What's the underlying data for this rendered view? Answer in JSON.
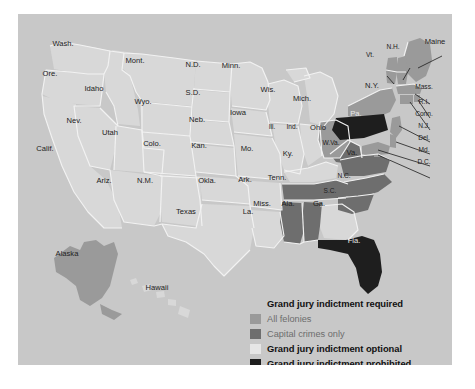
{
  "figure": {
    "panel_bg": "#c8c8c8",
    "page_bg": "#ffffff"
  },
  "colors": {
    "all_felonies": "#9a9a9a",
    "capital_crimes_only": "#6e6e6e",
    "optional": "#d8d8d8",
    "prohibited": "#1e1e1e",
    "border": "#f2f2f2",
    "label_dark": "#222222",
    "label_light": "#e8e8e8",
    "legend_title": "#111111",
    "legend_sub": "#6d6d6d"
  },
  "legend": {
    "required_title": "Grand jury indictment required",
    "sub_items": [
      {
        "label": "All felonies",
        "swatch": "all_felonies"
      },
      {
        "label": "Capital crimes only",
        "swatch": "capital_crimes_only"
      }
    ],
    "optional_title": "Grand jury indictment optional",
    "optional_swatch": "optional",
    "prohibited_title": "Grand jury indictment prohibited",
    "prohibited_swatch": "prohibited"
  },
  "chart_data": {
    "type": "map",
    "title": "Grand jury indictment required",
    "legend_position": "bottom-right",
    "categories": [
      "All felonies",
      "Capital crimes only",
      "Grand jury indictment optional",
      "Grand jury indictment prohibited"
    ],
    "states": [
      {
        "label": "Wash.",
        "category": "Grand jury indictment optional",
        "x": 63,
        "y": 46
      },
      {
        "label": "Ore.",
        "category": "Grand jury indictment optional",
        "x": 50,
        "y": 76
      },
      {
        "label": "Idaho",
        "category": "Grand jury indictment optional",
        "x": 94,
        "y": 91
      },
      {
        "label": "Mont.",
        "category": "Grand jury indictment optional",
        "x": 135,
        "y": 63
      },
      {
        "label": "Wyo.",
        "category": "Grand jury indictment optional",
        "x": 143,
        "y": 104
      },
      {
        "label": "Nev.",
        "category": "Grand jury indictment optional",
        "x": 74,
        "y": 123
      },
      {
        "label": "Utah",
        "category": "Grand jury indictment optional",
        "x": 110,
        "y": 135
      },
      {
        "label": "Calif.",
        "category": "Grand jury indictment optional",
        "x": 45,
        "y": 151
      },
      {
        "label": "Ariz.",
        "category": "Grand jury indictment optional",
        "x": 104,
        "y": 183
      },
      {
        "label": "N.M.",
        "category": "Grand jury indictment optional",
        "x": 145,
        "y": 183
      },
      {
        "label": "Colo.",
        "category": "Grand jury indictment optional",
        "x": 152,
        "y": 146
      },
      {
        "label": "N.D.",
        "category": "Grand jury indictment optional",
        "x": 193,
        "y": 67
      },
      {
        "label": "S.D.",
        "category": "Grand jury indictment optional",
        "x": 193,
        "y": 95
      },
      {
        "label": "Neb.",
        "category": "Grand jury indictment optional",
        "x": 197,
        "y": 122
      },
      {
        "label": "Kan.",
        "category": "Grand jury indictment optional",
        "x": 199,
        "y": 148
      },
      {
        "label": "Okla.",
        "category": "Grand jury indictment optional",
        "x": 207,
        "y": 183
      },
      {
        "label": "Texas",
        "category": "Grand jury indictment optional",
        "x": 186,
        "y": 214
      },
      {
        "label": "Minn.",
        "category": "Grand jury indictment optional",
        "x": 231,
        "y": 68
      },
      {
        "label": "Iowa",
        "category": "Grand jury indictment optional",
        "x": 238,
        "y": 115
      },
      {
        "label": "Mo.",
        "category": "Grand jury indictment optional",
        "x": 247,
        "y": 151
      },
      {
        "label": "Ark.",
        "category": "Grand jury indictment optional",
        "x": 245,
        "y": 182
      },
      {
        "label": "La.",
        "category": "Grand jury indictment optional",
        "x": 248,
        "y": 214
      },
      {
        "label": "Wis.",
        "category": "Grand jury indictment optional",
        "x": 268,
        "y": 92
      },
      {
        "label": "Ill.",
        "category": "Grand jury indictment optional",
        "x": 272,
        "y": 129
      },
      {
        "label": "Ind.",
        "category": "Grand jury indictment optional",
        "x": 292,
        "y": 129
      },
      {
        "label": "Mich.",
        "category": "Grand jury indictment optional",
        "x": 302,
        "y": 101
      },
      {
        "label": "Ky.",
        "category": "Grand jury indictment optional",
        "x": 288,
        "y": 156
      },
      {
        "label": "Ga.",
        "category": "Grand jury indictment optional",
        "x": 319,
        "y": 206
      },
      {
        "label": "Hawaii",
        "category": "Grand jury indictment optional",
        "x": 157,
        "y": 290
      },
      {
        "label": "Alaska",
        "category": "All felonies",
        "x": 67,
        "y": 256
      },
      {
        "label": "Ohio",
        "category": "All felonies",
        "x": 318,
        "y": 130
      },
      {
        "label": "N.Y.",
        "category": "All felonies",
        "x": 372,
        "y": 88
      },
      {
        "label": "Maine",
        "category": "All felonies",
        "x": 435,
        "y": 44
      },
      {
        "label": "N.H.",
        "category": "All felonies",
        "x": 393,
        "y": 49
      },
      {
        "label": "Vt.",
        "category": "All felonies",
        "x": 370,
        "y": 57
      },
      {
        "label": "Mass.",
        "category": "All felonies",
        "x": 424,
        "y": 89
      },
      {
        "label": "R.I.",
        "category": "All felonies",
        "x": 424,
        "y": 104
      },
      {
        "label": "Conn.",
        "category": "All felonies",
        "x": 424,
        "y": 116
      },
      {
        "label": "N.J.",
        "category": "All felonies",
        "x": 424,
        "y": 128
      },
      {
        "label": "Del.",
        "category": "All felonies",
        "x": 424,
        "y": 140
      },
      {
        "label": "Md.",
        "category": "All felonies",
        "x": 424,
        "y": 152
      },
      {
        "label": "D.C.",
        "category": "All felonies",
        "x": 424,
        "y": 164
      },
      {
        "label": "Tenn.",
        "category": "Capital crimes only",
        "x": 277,
        "y": 180
      },
      {
        "label": "Miss.",
        "category": "Capital crimes only",
        "x": 262,
        "y": 206
      },
      {
        "label": "Ala.",
        "category": "Capital crimes only",
        "x": 288,
        "y": 206
      },
      {
        "label": "N.C.",
        "category": "Capital crimes only",
        "x": 344,
        "y": 178
      },
      {
        "label": "S.C.",
        "category": "Capital crimes only",
        "x": 330,
        "y": 193
      },
      {
        "label": "Va.",
        "category": "Capital crimes only",
        "x": 352,
        "y": 155
      },
      {
        "label": "W.Va.",
        "category": "Capital crimes only",
        "x": 331,
        "y": 145
      },
      {
        "label": "Pa.",
        "category": "Grand jury indictment prohibited",
        "x": 356,
        "y": 116
      },
      {
        "label": "Fla.",
        "category": "Grand jury indictment prohibited",
        "x": 354,
        "y": 243
      }
    ]
  }
}
